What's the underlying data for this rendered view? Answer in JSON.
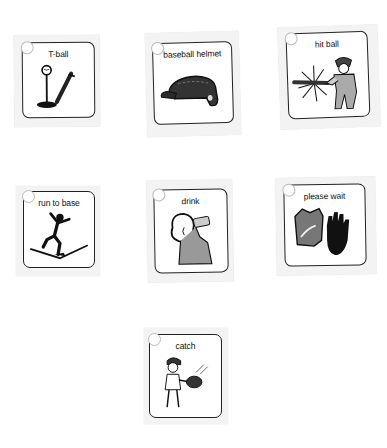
{
  "cards": [
    {
      "label": "T-ball",
      "icon": "t-ball-icon"
    },
    {
      "label": "baseball helmet",
      "icon": "baseball-helmet-icon"
    },
    {
      "label": "hit ball",
      "icon": "hit-ball-icon"
    },
    {
      "label": "run to base",
      "icon": "run-to-base-icon"
    },
    {
      "label": "drink",
      "icon": "drink-icon"
    },
    {
      "label": "please wait",
      "icon": "please-wait-icon"
    },
    {
      "label": "catch",
      "icon": "catch-icon"
    }
  ]
}
